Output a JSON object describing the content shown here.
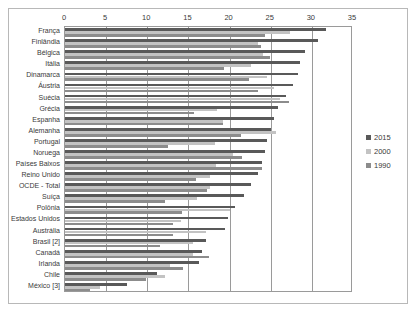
{
  "chart_data": {
    "type": "bar",
    "orientation": "horizontal",
    "title": "",
    "subtitle": "",
    "xlabel": "",
    "ylabel": "",
    "xlim": [
      0,
      35
    ],
    "xticks": [
      0,
      5,
      10,
      15,
      20,
      25,
      30,
      35
    ],
    "grid": true,
    "legend_position": "right",
    "legend": [
      "2015",
      "2000",
      "1990"
    ],
    "colors": {
      "2015": "#595959",
      "2000": "#c3c3c3",
      "1990": "#8c8c8c",
      "frame": "#b8b8b8",
      "axis": "#9a9a9a",
      "text": "#3a3a3a"
    },
    "categories": [
      "França",
      "Finlândia",
      "Bélgica",
      "Itália",
      "Dinamarca",
      "Áustria",
      "Suécia",
      "Grécia",
      "Espanha",
      "Alemanha",
      "Portugal",
      "Noruega",
      "Países Baixos",
      "Reino Unido",
      "OCDE - Total",
      "Suíça",
      "Polônia",
      "Estados Unidos",
      "Austrália",
      "Brasil [2]",
      "Canadá",
      "Irlanda",
      "Chile",
      "México [3]"
    ],
    "series": [
      {
        "name": "2015",
        "values": [
          31.7,
          30.8,
          29.2,
          28.5,
          28.3,
          27.7,
          26.8,
          25.9,
          25.4,
          25.0,
          24.6,
          24.3,
          23.9,
          23.4,
          22.6,
          21.7,
          20.6,
          19.8,
          19.4,
          17.1,
          16.6,
          16.3,
          11.2,
          7.5
        ],
        "color": "#595959"
      },
      {
        "name": "2000",
        "values": [
          27.4,
          23.5,
          24.1,
          22.6,
          24.5,
          25.4,
          26.1,
          18.5,
          19.2,
          25.6,
          18.2,
          20.4,
          18.4,
          17.6,
          17.6,
          16.1,
          20.0,
          14.1,
          17.1,
          15.6,
          15.5,
          12.7,
          12.2,
          4.2
        ],
        "color": "#c3c3c3"
      },
      {
        "name": "1990",
        "values": [
          24.3,
          23.8,
          24.9,
          19.3,
          22.4,
          23.4,
          27.2,
          15.7,
          19.2,
          21.4,
          12.5,
          21.5,
          24.0,
          15.9,
          17.2,
          12.2,
          14.2,
          13.1,
          13.1,
          11.5,
          17.5,
          14.3,
          9.8,
          3.0
        ],
        "color": "#8c8c8c"
      }
    ]
  }
}
